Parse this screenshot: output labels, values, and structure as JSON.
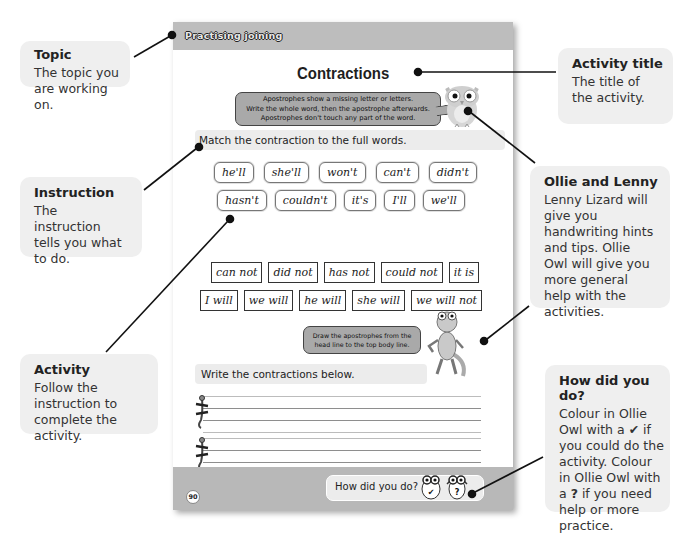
{
  "callouts": {
    "topic": {
      "title": "Topic",
      "body": "The topic you are working on."
    },
    "activity_title": {
      "title": "Activity title",
      "body": "The title of the activity."
    },
    "instruction": {
      "title": "Instruction",
      "body": "The instruction tells you what to do."
    },
    "ollie_lenny": {
      "title": "Ollie and Lenny",
      "body": "Lenny Lizard will give you handwriting hints and tips. Ollie Owl will give you more general help with the activities."
    },
    "activity": {
      "title": "Activity",
      "body": "Follow the instruction to complete the activity."
    },
    "how_did_you_do": {
      "title": "How did you do?",
      "body_1": "Colour in Ollie Owl with a ",
      "tick": "✔",
      "body_2": " if you could do the activity. Colour in Ollie Owl with a ",
      "question": "?",
      "body_3": " if you need help or more practice."
    }
  },
  "page": {
    "topic": "Practising joining",
    "title": "Contractions",
    "owl_hint": [
      "Apostrophes show a missing letter or letters.",
      "Write the whole word, then the apostrophe afterwards.",
      "Apostrophes don't touch any part of the word."
    ],
    "instruction": "Match the contraction to the full words.",
    "contractions_row1": [
      "he'll",
      "she'll",
      "won't",
      "can't",
      "didn't"
    ],
    "contractions_row2": [
      "hasn't",
      "couldn't",
      "it's",
      "I'll",
      "we'll"
    ],
    "full_words_row1": [
      "can not",
      "did not",
      "has not",
      "could not",
      "it is"
    ],
    "full_words_row2": [
      "I will",
      "we will",
      "he will",
      "she will",
      "we will not"
    ],
    "lenny_hint": [
      "Draw the apostrophes from the",
      "head line to the top body line."
    ],
    "write_instruction": "Write the contractions below.",
    "footer": {
      "page_number": "90",
      "how_did_you_do": "How did you do?",
      "owl_tick": "✔",
      "owl_question": "?"
    }
  },
  "colors": {
    "callout_bg": "#efefef",
    "page_header": "#bdbdbd",
    "page_footer": "#b8b8b8",
    "hint_bubble": "#a9a9a9",
    "instruction_bar": "#ececec"
  }
}
